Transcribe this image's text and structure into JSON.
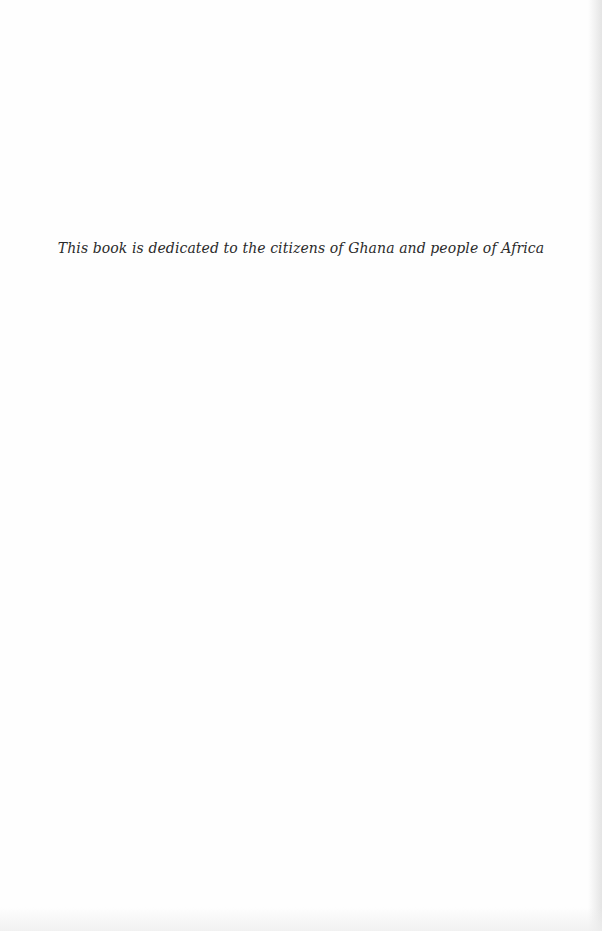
{
  "page": {
    "dedication": "This book is dedicated to the citizens of Ghana and people of Africa"
  }
}
